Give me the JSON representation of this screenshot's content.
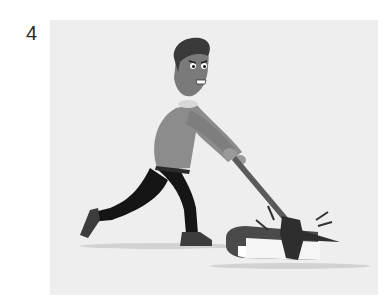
{
  "label": "4",
  "illustration": {
    "subject": "man-chopping-book-with-axe",
    "style": "grayscale",
    "colors": {
      "background": "#eeeeee",
      "skin": "#7a7a7a",
      "hair": "#3a3a3a",
      "sweater": "#8c8c8c",
      "pants": "#151515",
      "shoes": "#3c3c3c",
      "axe_handle": "#5a5a5a",
      "axe_head": "#2e2e2e",
      "book_cover": "#4a4a4a",
      "book_pages": "#f5f5f5",
      "shadow": "#cfcfcf"
    }
  }
}
